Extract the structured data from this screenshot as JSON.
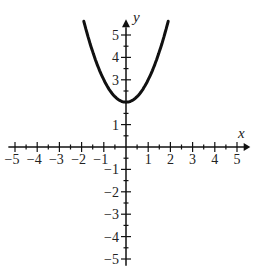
{
  "chart_data": {
    "type": "line",
    "title": "",
    "xlabel": "x",
    "ylabel": "y",
    "xlim": [
      -5,
      5
    ],
    "ylim": [
      -5,
      5
    ],
    "grid": false,
    "legend": null,
    "x_ticks": [
      -5,
      -4,
      -3,
      -2,
      -1,
      1,
      2,
      3,
      4,
      5
    ],
    "x_tick_labels": [
      "−5",
      "−4",
      "−3",
      "−2",
      "−1",
      "1",
      "2",
      "3",
      "4",
      "5"
    ],
    "y_ticks": [
      -5,
      -4,
      -3,
      -2,
      -1,
      1,
      2,
      3,
      4,
      5
    ],
    "y_tick_labels": [
      "−5",
      "−4",
      "−3",
      "−2",
      "−1",
      "1",
      "",
      "3",
      "4",
      "5"
    ],
    "minor_tick_step": 0.5,
    "series": [
      {
        "name": "y = x^2 + 2",
        "x": [
          -1.8,
          -1.6,
          -1.4,
          -1.2,
          -1.0,
          -0.8,
          -0.6,
          -0.4,
          -0.2,
          0,
          0.2,
          0.4,
          0.6,
          0.8,
          1.0,
          1.2,
          1.4,
          1.6,
          1.8
        ],
        "values": [
          5.24,
          4.56,
          3.96,
          3.44,
          3.0,
          2.64,
          2.36,
          2.16,
          2.04,
          2.0,
          2.04,
          2.16,
          2.36,
          2.64,
          3.0,
          3.44,
          3.96,
          4.56,
          5.24
        ],
        "color": "#111111"
      }
    ]
  }
}
